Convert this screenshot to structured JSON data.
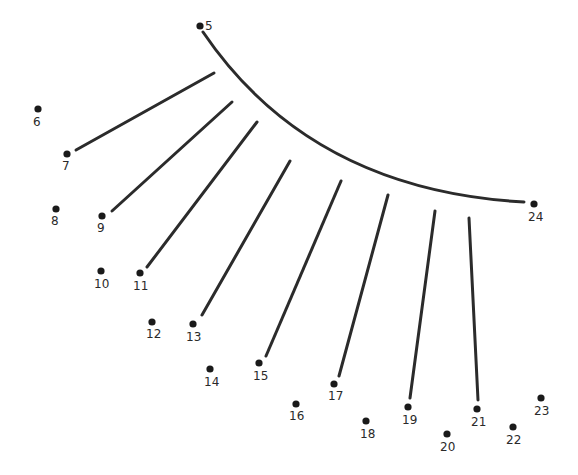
{
  "line_color": "#2b2b2b",
  "dot_color": "#1a1a1a",
  "dots": [
    {
      "n": "5",
      "x": 200,
      "y": 26,
      "lx": 205,
      "ly": 20
    },
    {
      "n": "6",
      "x": 38,
      "y": 109,
      "lx": 33,
      "ly": 116
    },
    {
      "n": "7",
      "x": 67,
      "y": 154,
      "lx": 62,
      "ly": 160
    },
    {
      "n": "8",
      "x": 56,
      "y": 209,
      "lx": 51,
      "ly": 215
    },
    {
      "n": "9",
      "x": 102,
      "y": 216,
      "lx": 97,
      "ly": 222
    },
    {
      "n": "10",
      "x": 101,
      "y": 271,
      "lx": 94,
      "ly": 278
    },
    {
      "n": "11",
      "x": 140,
      "y": 273,
      "lx": 133,
      "ly": 280
    },
    {
      "n": "12",
      "x": 152,
      "y": 322,
      "lx": 146,
      "ly": 328
    },
    {
      "n": "13",
      "x": 193,
      "y": 324,
      "lx": 186,
      "ly": 331
    },
    {
      "n": "14",
      "x": 210,
      "y": 369,
      "lx": 204,
      "ly": 376
    },
    {
      "n": "15",
      "x": 259,
      "y": 363,
      "lx": 253,
      "ly": 370
    },
    {
      "n": "16",
      "x": 296,
      "y": 404,
      "lx": 289,
      "ly": 410
    },
    {
      "n": "17",
      "x": 334,
      "y": 384,
      "lx": 328,
      "ly": 390
    },
    {
      "n": "18",
      "x": 366,
      "y": 421,
      "lx": 360,
      "ly": 428
    },
    {
      "n": "19",
      "x": 408,
      "y": 407,
      "lx": 402,
      "ly": 414
    },
    {
      "n": "20",
      "x": 447,
      "y": 434,
      "lx": 440,
      "ly": 441
    },
    {
      "n": "21",
      "x": 477,
      "y": 409,
      "lx": 471,
      "ly": 416
    },
    {
      "n": "22",
      "x": 513,
      "y": 427,
      "lx": 506,
      "ly": 434
    },
    {
      "n": "23",
      "x": 541,
      "y": 398,
      "lx": 534,
      "ly": 405
    },
    {
      "n": "24",
      "x": 534,
      "y": 204,
      "lx": 528,
      "ly": 211
    }
  ],
  "curve": "M 203 32 Q 310 190 524 202",
  "segments": [
    {
      "x1": 76,
      "y1": 150,
      "x2": 214,
      "y2": 73
    },
    {
      "x1": 112,
      "y1": 211,
      "x2": 232,
      "y2": 102
    },
    {
      "x1": 147,
      "y1": 267,
      "x2": 257,
      "y2": 122
    },
    {
      "x1": 202,
      "y1": 315,
      "x2": 290,
      "y2": 161
    },
    {
      "x1": 266,
      "y1": 356,
      "x2": 341,
      "y2": 181
    },
    {
      "x1": 339,
      "y1": 376,
      "x2": 388,
      "y2": 195
    },
    {
      "x1": 410,
      "y1": 398,
      "x2": 435,
      "y2": 211
    },
    {
      "x1": 478,
      "y1": 400,
      "x2": 469,
      "y2": 218
    }
  ]
}
